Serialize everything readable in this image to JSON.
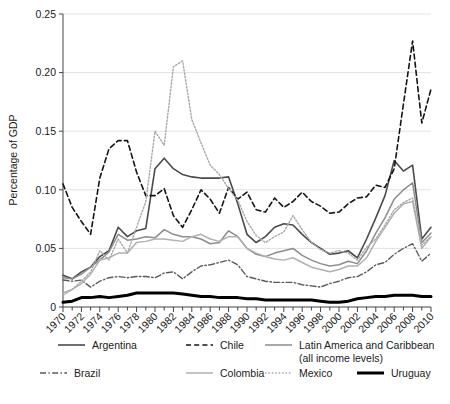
{
  "chart_data": {
    "type": "line",
    "title": "",
    "xlabel": "",
    "ylabel": "Percentage of GDP",
    "xlim": [
      1970,
      2010
    ],
    "ylim": [
      0,
      0.25
    ],
    "ytick_values": [
      0,
      0.05,
      0.1,
      0.15,
      0.2,
      0.25
    ],
    "ytick_labels": [
      "0",
      "0.05",
      "0.10",
      "0.15",
      "0.20",
      "0.25"
    ],
    "xtick_labels": [
      "1970",
      "1972",
      "1974",
      "1976",
      "1978",
      "1980",
      "1982",
      "1984",
      "1986",
      "1988",
      "1990",
      "1992",
      "1994",
      "1996",
      "1998",
      "2000",
      "2002",
      "2004",
      "2006",
      "2008",
      "2010"
    ],
    "xtick_step": 2,
    "minor_xticks_every": 1,
    "grid": "horizontal",
    "legend_position": "bottom",
    "x": [
      1970,
      1971,
      1972,
      1973,
      1974,
      1975,
      1976,
      1977,
      1978,
      1979,
      1980,
      1981,
      1982,
      1983,
      1984,
      1985,
      1986,
      1987,
      1988,
      1989,
      1990,
      1991,
      1992,
      1993,
      1994,
      1995,
      1996,
      1997,
      1998,
      1999,
      2000,
      2001,
      2002,
      2003,
      2004,
      2005,
      2006,
      2007,
      2008,
      2009,
      2010
    ],
    "series": [
      {
        "name": "Argentina",
        "style": "solid",
        "color": "#4a4a4a",
        "width": 1.6,
        "values": [
          0.027,
          0.024,
          0.03,
          0.034,
          0.043,
          0.048,
          0.068,
          0.06,
          0.065,
          0.067,
          0.118,
          0.127,
          0.118,
          0.113,
          0.111,
          0.11,
          0.11,
          0.11,
          0.111,
          0.088,
          0.062,
          0.055,
          0.06,
          0.068,
          0.071,
          0.07,
          0.062,
          0.055,
          0.05,
          0.045,
          0.046,
          0.048,
          0.042,
          0.058,
          0.076,
          0.095,
          0.125,
          0.116,
          0.121,
          0.058,
          0.068
        ]
      },
      {
        "name": "Chile",
        "style": "dashed",
        "color": "#141414",
        "width": 1.6,
        "values": [
          0.105,
          0.085,
          0.073,
          0.062,
          0.11,
          0.135,
          0.142,
          0.142,
          0.115,
          0.095,
          0.095,
          0.101,
          0.078,
          0.068,
          0.083,
          0.1,
          0.092,
          0.08,
          0.102,
          0.092,
          0.098,
          0.083,
          0.081,
          0.093,
          0.085,
          0.09,
          0.098,
          0.09,
          0.086,
          0.08,
          0.081,
          0.088,
          0.093,
          0.094,
          0.104,
          0.102,
          0.118,
          0.173,
          0.227,
          0.157,
          0.186
        ]
      },
      {
        "name": "Latin America and Caribbean (all income levels)",
        "style": "solid",
        "color": "#8c8c8c",
        "width": 1.5,
        "values": [
          0.025,
          0.024,
          0.028,
          0.034,
          0.04,
          0.047,
          0.062,
          0.057,
          0.058,
          0.06,
          0.059,
          0.066,
          0.062,
          0.06,
          0.06,
          0.058,
          0.054,
          0.055,
          0.065,
          0.06,
          0.05,
          0.045,
          0.043,
          0.046,
          0.048,
          0.05,
          0.044,
          0.04,
          0.037,
          0.035,
          0.036,
          0.039,
          0.037,
          0.048,
          0.063,
          0.076,
          0.092,
          0.1,
          0.106,
          0.055,
          0.063
        ]
      },
      {
        "name": "Brazil",
        "style": "dashdot",
        "color": "#5a5a5a",
        "width": 1.4,
        "values": [
          0.023,
          0.022,
          0.023,
          0.017,
          0.022,
          0.025,
          0.026,
          0.025,
          0.026,
          0.026,
          0.025,
          0.029,
          0.03,
          0.024,
          0.03,
          0.035,
          0.036,
          0.038,
          0.04,
          0.036,
          0.026,
          0.024,
          0.022,
          0.021,
          0.021,
          0.021,
          0.019,
          0.018,
          0.017,
          0.02,
          0.022,
          0.025,
          0.026,
          0.03,
          0.036,
          0.038,
          0.045,
          0.05,
          0.054,
          0.039,
          0.046
        ]
      },
      {
        "name": "Colombia",
        "style": "solid",
        "color": "#b0b0b0",
        "width": 1.5,
        "values": [
          0.012,
          0.015,
          0.02,
          0.028,
          0.04,
          0.042,
          0.046,
          0.046,
          0.055,
          0.056,
          0.058,
          0.058,
          0.057,
          0.056,
          0.06,
          0.062,
          0.058,
          0.056,
          0.06,
          0.06,
          0.05,
          0.046,
          0.043,
          0.041,
          0.04,
          0.042,
          0.038,
          0.034,
          0.032,
          0.03,
          0.032,
          0.035,
          0.035,
          0.042,
          0.056,
          0.068,
          0.08,
          0.088,
          0.09,
          0.05,
          0.06
        ]
      },
      {
        "name": "Mexico",
        "style": "dotted",
        "color": "#a9a9a9",
        "width": 1.4,
        "values": [
          0.01,
          0.015,
          0.022,
          0.03,
          0.048,
          0.04,
          0.058,
          0.046,
          0.068,
          0.09,
          0.15,
          0.138,
          0.205,
          0.21,
          0.16,
          0.14,
          0.121,
          0.113,
          0.101,
          0.091,
          0.073,
          0.061,
          0.055,
          0.06,
          0.064,
          0.078,
          0.066,
          0.055,
          0.049,
          0.046,
          0.048,
          0.046,
          0.04,
          0.051,
          0.058,
          0.07,
          0.083,
          0.089,
          0.093,
          0.053,
          0.06
        ]
      },
      {
        "name": "Uruguay",
        "style": "solid",
        "color": "#000000",
        "width": 3.0,
        "values": [
          0.004,
          0.005,
          0.008,
          0.008,
          0.009,
          0.008,
          0.009,
          0.01,
          0.012,
          0.012,
          0.012,
          0.012,
          0.012,
          0.011,
          0.01,
          0.009,
          0.009,
          0.008,
          0.008,
          0.008,
          0.007,
          0.007,
          0.006,
          0.006,
          0.006,
          0.006,
          0.006,
          0.006,
          0.005,
          0.004,
          0.004,
          0.005,
          0.007,
          0.008,
          0.009,
          0.009,
          0.01,
          0.01,
          0.01,
          0.009,
          0.009
        ]
      }
    ]
  },
  "legend": {
    "entries": [
      {
        "label": "Argentina",
        "series": "Argentina"
      },
      {
        "label": "Chile",
        "series": "Chile"
      },
      {
        "label": "Latin America and Caribbean",
        "label2": "(all income levels)",
        "series": "Latin America and Caribbean (all income levels)"
      },
      {
        "label": "Brazil",
        "series": "Brazil"
      },
      {
        "label": "Colombia",
        "series": "Colombia"
      },
      {
        "label": "Mexico",
        "series": "Mexico"
      },
      {
        "label": "Uruguay",
        "series": "Uruguay"
      }
    ]
  }
}
